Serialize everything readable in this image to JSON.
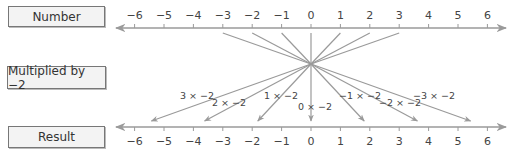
{
  "labels": {
    "number": "Number",
    "multiplied": "Multiplied by −2",
    "result": "Result"
  },
  "colors": {
    "line": "#9a9a9a",
    "box_fill": "#f3f3f3",
    "box_border": "#777777",
    "text": "#333333"
  },
  "number_line": {
    "ticks": [
      "−6",
      "−5",
      "−4",
      "−3",
      "−2",
      "−1",
      "0",
      "1",
      "2",
      "3",
      "4",
      "5",
      "6"
    ]
  },
  "mappings": [
    {
      "input": "3",
      "label": "3 × −2",
      "output": "−6"
    },
    {
      "input": "2",
      "label": "2 × −2",
      "output": "−4"
    },
    {
      "input": "1",
      "label": "1 × −2",
      "output": "−2"
    },
    {
      "input": "0",
      "label": "0 × −2",
      "output": "0"
    },
    {
      "input": "−1",
      "label": "−1 × −2",
      "output": "2"
    },
    {
      "input": "−2",
      "label": "−2 × −2",
      "output": "4"
    },
    {
      "input": "−3",
      "label": "−3 × −2",
      "output": "6"
    }
  ],
  "chart_data": {
    "type": "diagram",
    "top_axis": {
      "label": "Number",
      "range": [
        -6,
        6
      ],
      "ticks": [
        -6,
        -5,
        -4,
        -3,
        -2,
        -1,
        0,
        1,
        2,
        3,
        4,
        5,
        6
      ]
    },
    "operation": "Multiplied by −2",
    "bottom_axis": {
      "label": "Result",
      "range": [
        -6,
        6
      ],
      "ticks": [
        -6,
        -5,
        -4,
        -3,
        -2,
        -1,
        0,
        1,
        2,
        3,
        4,
        5,
        6
      ]
    },
    "mappings": [
      {
        "x": 3,
        "y": -6
      },
      {
        "x": 2,
        "y": -4
      },
      {
        "x": 1,
        "y": -2
      },
      {
        "x": 0,
        "y": 0
      },
      {
        "x": -1,
        "y": 2
      },
      {
        "x": -2,
        "y": 4
      },
      {
        "x": -3,
        "y": 6
      }
    ]
  }
}
